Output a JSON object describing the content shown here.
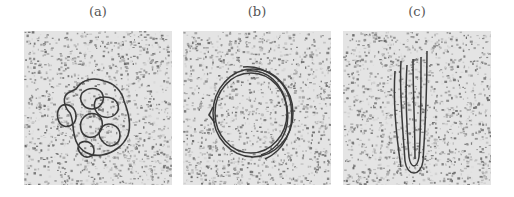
{
  "figure": {
    "panels": [
      {
        "label": "(a)",
        "description": "Tangled, compact cluster of loops"
      },
      {
        "label": "(b)",
        "description": "Circular toroid formed by multiple strands"
      },
      {
        "label": "(c)",
        "description": "Elongated, rod-like hairpin structure of parallel strands"
      }
    ],
    "style": {
      "background": "#ffffff",
      "noise_light": "#e6e6e6",
      "noise_dark": "#7a7a7a",
      "strand_color": "#3a3a3a",
      "label_color": "#555555"
    }
  }
}
